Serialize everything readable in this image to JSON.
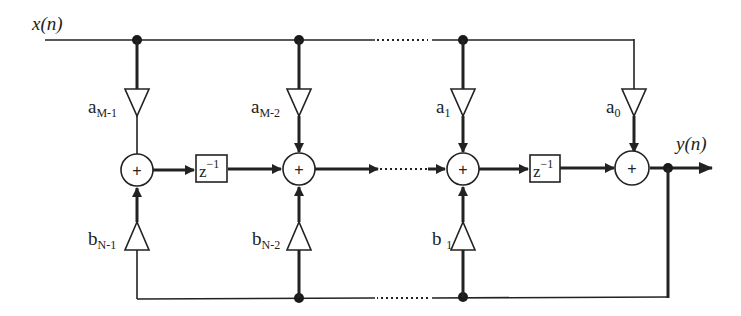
{
  "diagram": {
    "type": "IIR filter direct-form signal flow graph",
    "input_label": "x(n)",
    "output_label": "y(n)",
    "delay_label": {
      "base": "z",
      "exp": "−1"
    },
    "adder_symbol": "+",
    "feedforward_gains": [
      {
        "base": "a",
        "sub": "M-1"
      },
      {
        "base": "a",
        "sub": "M-2"
      },
      {
        "base": "a",
        "sub": "1"
      },
      {
        "base": "a",
        "sub": "0"
      }
    ],
    "feedback_gains": [
      {
        "base": "b",
        "sub": "N-1"
      },
      {
        "base": "b",
        "sub": "N-2"
      },
      {
        "base": "b ",
        "sub": "1"
      }
    ],
    "colors": {
      "stroke": "#222222",
      "background": "#ffffff"
    }
  }
}
